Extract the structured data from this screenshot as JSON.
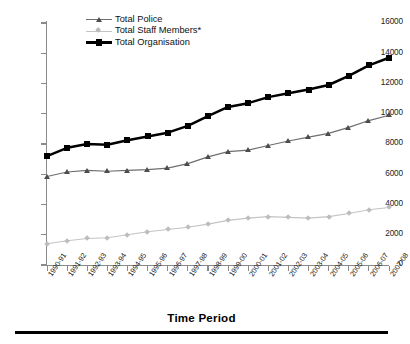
{
  "chart_data": {
    "type": "line",
    "title": "",
    "xlabel": "Time Period",
    "ylabel": "",
    "ylim": [
      0,
      16000
    ],
    "ytick_step": 2000,
    "yticks": [
      "0",
      "2000",
      "4000",
      "6000",
      "8000",
      "10000",
      "12000",
      "14000",
      "16000"
    ],
    "grid": false,
    "legend_position": "top-center",
    "categories": [
      "1990-91",
      "1991-92",
      "1992-93",
      "1993-94",
      "1994-95",
      "1995-96",
      "1996-97",
      "1997-98",
      "1998-99",
      "1999-00",
      "2000-01",
      "2001-02",
      "2002-03",
      "2003-04",
      "2004-05",
      "2005-06",
      "2006-07",
      "2007-08"
    ],
    "series": [
      {
        "name": "Total Police",
        "marker": "triangle",
        "color": "#4d4d4d",
        "values": [
          5850,
          6150,
          6250,
          6200,
          6250,
          6300,
          6400,
          6700,
          7150,
          7500,
          7600,
          7900,
          8200,
          8450,
          8700,
          9100,
          9550,
          9900
        ]
      },
      {
        "name": "Total Staff Members*",
        "marker": "diamond",
        "color": "#bdbdbd",
        "values": [
          1400,
          1600,
          1750,
          1800,
          2000,
          2200,
          2350,
          2500,
          2700,
          2950,
          3100,
          3200,
          3150,
          3100,
          3200,
          3400,
          3650,
          3800
        ]
      },
      {
        "name": "Total Organisation",
        "marker": "square",
        "color": "#000000",
        "values": [
          7200,
          7750,
          8000,
          7950,
          8250,
          8500,
          8750,
          9200,
          9850,
          10450,
          10700,
          11100,
          11350,
          11600,
          11900,
          12500,
          13200,
          13700
        ]
      }
    ]
  },
  "legend": {
    "items": [
      {
        "label": "Total Police"
      },
      {
        "label": "Total Staff Members*"
      },
      {
        "label": "Total Organisation"
      }
    ]
  },
  "axis": {
    "x_title": "Time Period"
  }
}
